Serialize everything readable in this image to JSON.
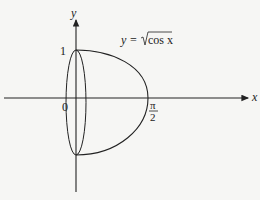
{
  "diagram": {
    "type": "solid-of-revolution-sketch",
    "axes": {
      "x_label": "x",
      "y_label": "y",
      "origin_label": "0",
      "y_tick_label": "1",
      "x_tick_label_num": "π",
      "x_tick_label_den": "2"
    },
    "curve_label": {
      "prefix": "y =",
      "radical": "cos x"
    },
    "colors": {
      "stroke": "#222222",
      "background": "#f6f6f4"
    }
  }
}
